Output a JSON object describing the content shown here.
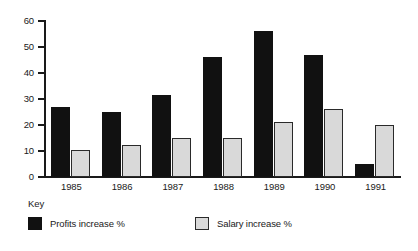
{
  "chart_data": {
    "type": "bar",
    "title": "",
    "xlabel": "",
    "ylabel": "",
    "categories": [
      "1985",
      "1986",
      "1987",
      "1988",
      "1989",
      "1990",
      "1991"
    ],
    "series": [
      {
        "name": "Profits increase %",
        "color": "#111111",
        "values": [
          27,
          25,
          31.5,
          46,
          56,
          47,
          5
        ]
      },
      {
        "name": "Salary increase %",
        "color": "#d9d9d9",
        "values": [
          10.5,
          12.5,
          15,
          15,
          21,
          26,
          20
        ]
      }
    ],
    "ylim": [
      0,
      60
    ],
    "ytick_values": [
      0,
      10,
      20,
      30,
      40,
      50,
      60
    ],
    "ytick_labels": [
      "0",
      "10",
      "20",
      "30",
      "40",
      "50",
      "60"
    ],
    "grid": false,
    "legend_position": "bottom-left"
  },
  "key": {
    "title": "Key",
    "entries": [
      {
        "label": "Profits increase %",
        "swatch": "black-square-icon"
      },
      {
        "label": "Salary increase %",
        "swatch": "gray-square-icon"
      }
    ]
  }
}
